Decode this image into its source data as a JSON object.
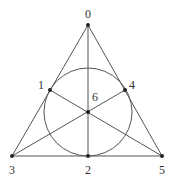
{
  "colors": {
    "line": "#555555",
    "point": "#222222",
    "background": "#ffffff"
  },
  "points": [
    {
      "id": "0",
      "label": "0",
      "x": 88,
      "y": 25,
      "lx": 88,
      "ly": 18
    },
    {
      "id": "1",
      "label": "1",
      "x": 50,
      "y": 90,
      "lx": 41,
      "ly": 89
    },
    {
      "id": "2",
      "label": "2",
      "x": 88,
      "y": 156,
      "lx": 88,
      "ly": 174
    },
    {
      "id": "3",
      "label": "3",
      "x": 12,
      "y": 156,
      "lx": 12,
      "ly": 174
    },
    {
      "id": "4",
      "label": "4",
      "x": 125,
      "y": 90,
      "lx": 132,
      "ly": 89
    },
    {
      "id": "5",
      "label": "5",
      "x": 162,
      "y": 156,
      "lx": 162,
      "ly": 174
    },
    {
      "id": "6",
      "label": "6",
      "x": 88,
      "y": 112,
      "lx": 95,
      "ly": 101
    }
  ],
  "lines": [
    [
      "0",
      "1",
      "3"
    ],
    [
      "0",
      "4",
      "5"
    ],
    [
      "3",
      "2",
      "5"
    ],
    [
      "0",
      "6",
      "2"
    ],
    [
      "1",
      "6",
      "5"
    ],
    [
      "3",
      "6",
      "4"
    ]
  ],
  "circle": {
    "cx": 88,
    "cy": 112,
    "r": 44,
    "through": [
      "1",
      "4",
      "2"
    ]
  }
}
